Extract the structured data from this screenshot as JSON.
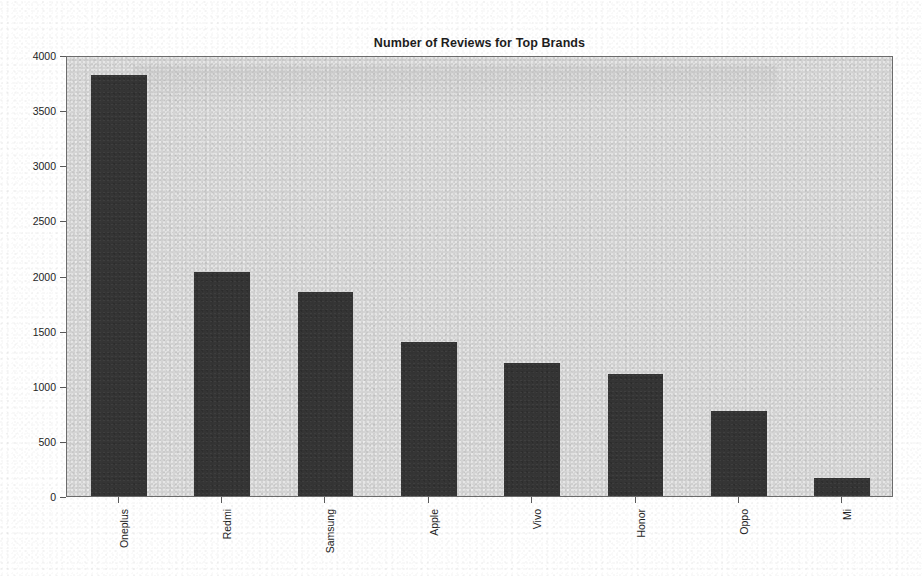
{
  "chart_data": {
    "type": "bar",
    "title": "Number of Reviews for Top Brands",
    "xlabel": "",
    "ylabel": "",
    "categories": [
      "Oneplus",
      "Redmi",
      "Samsung",
      "Apple",
      "Vivo",
      "Honor",
      "Oppo",
      "Mi"
    ],
    "values": [
      3820,
      2030,
      1850,
      1400,
      1210,
      1110,
      770,
      165
    ],
    "ylim": [
      0,
      4000
    ],
    "yticks": [
      0,
      500,
      1000,
      1500,
      2000,
      2500,
      3000,
      3500,
      4000
    ],
    "ytick_labels": [
      "0",
      "500",
      "1000",
      "1500",
      "2000",
      "2500",
      "3000",
      "3500",
      "4000"
    ],
    "grid": false,
    "legend": null,
    "legend_position": "none",
    "bar_color": "#353535",
    "plot_background": "#d4d4d4",
    "figure_background": "#ffffff",
    "xtick_label_rotation": 90
  }
}
